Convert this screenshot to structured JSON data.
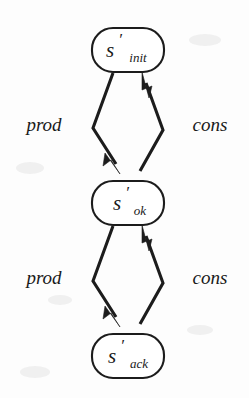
{
  "diagram": {
    "background_color": "#fdfdfd",
    "ink_color": "#1c1c1c",
    "nodes": [
      {
        "id": "s-init",
        "name": "s'_init",
        "base": "s",
        "prime": "′",
        "subscript": "init",
        "shape": "stadium",
        "cx": 128,
        "cy": 50,
        "rx": 36,
        "ry": 22
      },
      {
        "id": "s-ok",
        "name": "s'_ok",
        "base": "s",
        "prime": "′",
        "subscript": "ok",
        "shape": "stadium",
        "cx": 128,
        "cy": 203,
        "rx": 36,
        "ry": 22
      },
      {
        "id": "s-ack",
        "name": "s'_ack",
        "base": "s",
        "prime": "′",
        "subscript": "ack",
        "shape": "stadium",
        "cx": 128,
        "cy": 356,
        "rx": 36,
        "ry": 22
      }
    ],
    "edges": [
      {
        "id": "edge-prod-init-ok",
        "label": "prod",
        "from": "s-init",
        "to": "s-ok",
        "direction": "down",
        "side": "left",
        "label_x": 44,
        "label_y": 125
      },
      {
        "id": "edge-cons-ok-init",
        "label": "cons",
        "from": "s-ok",
        "to": "s-init",
        "direction": "up",
        "side": "right",
        "label_x": 212,
        "label_y": 125
      },
      {
        "id": "edge-prod-ok-ack",
        "label": "prod",
        "from": "s-ok",
        "to": "s-ack",
        "direction": "down",
        "side": "left",
        "label_x": 44,
        "label_y": 278
      },
      {
        "id": "edge-cons-ack-ok",
        "label": "cons",
        "from": "s-ack",
        "to": "s-ok",
        "direction": "up",
        "side": "right",
        "label_x": 212,
        "label_y": 278
      }
    ]
  }
}
